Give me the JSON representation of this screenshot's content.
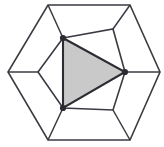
{
  "figure": {
    "type": "line-diagram",
    "canvas": {
      "width": 164,
      "height": 147,
      "background": "#ffffff"
    },
    "colors": {
      "stroke": "#3a3a42",
      "shaded_face_fill": "#c9c9c9",
      "shaded_face_stroke": "#2c2c33",
      "vertex_dot": "#2b2b31"
    },
    "outer_hexagon": {
      "name": "outer-hexagon",
      "points": "48,5 130,5 160,72 130,140 48,140 8,72",
      "vertices": [
        {
          "label": "top-left",
          "x": 48,
          "y": 5
        },
        {
          "label": "top-right",
          "x": 130,
          "y": 5
        },
        {
          "label": "right",
          "x": 160,
          "y": 72
        },
        {
          "label": "bottom-right",
          "x": 130,
          "y": 140
        },
        {
          "label": "bottom-left",
          "x": 48,
          "y": 140
        },
        {
          "label": "left",
          "x": 8,
          "y": 72
        }
      ]
    },
    "inner_hexagon": {
      "name": "inner-hexagon",
      "points": "63,38 113,29 125,72 113,110 63,108 38,72",
      "vertices": [
        {
          "label": "top-left",
          "x": 63,
          "y": 38
        },
        {
          "label": "top-right",
          "x": 113,
          "y": 29
        },
        {
          "label": "right",
          "x": 125,
          "y": 72
        },
        {
          "label": "bottom-right",
          "x": 113,
          "y": 110
        },
        {
          "label": "bottom-left",
          "x": 63,
          "y": 108
        },
        {
          "label": "left",
          "x": 38,
          "y": 72
        }
      ]
    },
    "connectors": [
      {
        "name": "connector-top-left",
        "x1": 63,
        "y1": 38,
        "x2": 48,
        "y2": 5
      },
      {
        "name": "connector-top-right",
        "x1": 113,
        "y1": 29,
        "x2": 130,
        "y2": 5
      },
      {
        "name": "connector-right",
        "x1": 125,
        "y1": 72,
        "x2": 160,
        "y2": 72
      },
      {
        "name": "connector-bottom-right",
        "x1": 113,
        "y1": 110,
        "x2": 130,
        "y2": 140
      },
      {
        "name": "connector-bottom-left",
        "x1": 63,
        "y1": 108,
        "x2": 48,
        "y2": 140
      },
      {
        "name": "connector-left",
        "x1": 38,
        "y1": 72,
        "x2": 8,
        "y2": 72
      }
    ],
    "shaded_triangle": {
      "name": "shaded-triangle",
      "points": "63,38 125,72 63,108",
      "fill": "#c9c9c9",
      "vertices": [
        {
          "label": "apex-top",
          "x": 63,
          "y": 38
        },
        {
          "label": "apex-right",
          "x": 125,
          "y": 72
        },
        {
          "label": "apex-bottom",
          "x": 63,
          "y": 108
        }
      ]
    },
    "vertex_markers": [
      {
        "name": "vertex-marker-top",
        "x": 63,
        "y": 38,
        "r": 3.1
      },
      {
        "name": "vertex-marker-right",
        "x": 125,
        "y": 72,
        "r": 3.1
      },
      {
        "name": "vertex-marker-bottom",
        "x": 63,
        "y": 108,
        "r": 3.1
      }
    ]
  }
}
